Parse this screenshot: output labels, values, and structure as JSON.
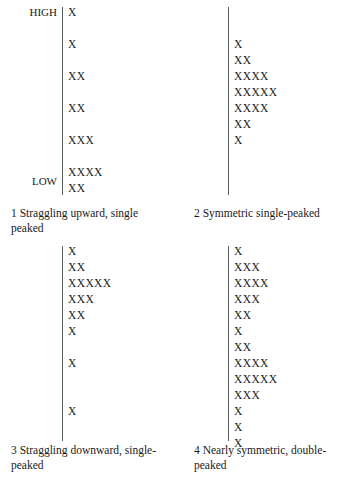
{
  "figure": {
    "axis_labels": {
      "high": "HIGH",
      "low": "LOW"
    },
    "accent_color": "#555f66",
    "text_color": "#1a1a1a",
    "mark": "X"
  },
  "panels": [
    {
      "id": "panel-1",
      "number": "1",
      "caption": "1  Straggling upward, single peaked",
      "shape_name": "Straggling upward, single peaked",
      "has_axis_labels": true,
      "counts": [
        1,
        0,
        1,
        0,
        2,
        0,
        2,
        0,
        3,
        0,
        4,
        2
      ],
      "rows": [
        "X",
        "",
        "X",
        "",
        "XX",
        "",
        "XX",
        "",
        "XXX",
        "",
        "XXXX",
        "XX"
      ]
    },
    {
      "id": "panel-2",
      "number": "2",
      "caption": "2  Symmetric single-peaked",
      "shape_name": "Symmetric single-peaked",
      "has_axis_labels": false,
      "counts": [
        0,
        0,
        1,
        2,
        4,
        5,
        4,
        2,
        1
      ],
      "rows": [
        "",
        "",
        "X",
        "XX",
        "XXXX",
        "XXXXX",
        "XXXX",
        "XX",
        "X"
      ]
    },
    {
      "id": "panel-3",
      "number": "3",
      "caption": "3  Straggling downward, single-peaked",
      "shape_name": "Straggling downward, single-peaked",
      "has_axis_labels": false,
      "counts": [
        1,
        2,
        5,
        3,
        2,
        1,
        0,
        1,
        0,
        0,
        1
      ],
      "rows": [
        "X",
        "XX",
        "XXXXX",
        "XXX",
        "XX",
        "X",
        "",
        "X",
        "",
        "",
        "X"
      ]
    },
    {
      "id": "panel-4",
      "number": "4",
      "caption": "4  Nearly symmetric, double-peaked",
      "shape_name": "Nearly symmetric, double-peaked",
      "has_axis_labels": false,
      "counts": [
        1,
        3,
        4,
        3,
        2,
        1,
        2,
        4,
        5,
        3,
        1,
        1,
        1
      ],
      "rows": [
        "X",
        "XXX",
        "XXXX",
        "XXX",
        "XX",
        "X",
        "XX",
        "XXXX",
        "XXXXX",
        "XXX",
        "X",
        "X",
        "X"
      ]
    }
  ],
  "chart_data": {
    "type": "bar",
    "title": "",
    "xlabel": "",
    "ylabel": "",
    "orientation": "horizontal-dotplot",
    "note": "Four schematic tally/dot-plot distributions drawn with X marks; vertical axis runs HIGH at top to LOW at bottom; each row's X count is the frequency at that level.",
    "axis_ticks": [
      "HIGH",
      "LOW"
    ],
    "grid": false,
    "legend": "none",
    "series": [
      {
        "name": "1  Straggling upward, single peaked",
        "values": [
          1,
          0,
          1,
          0,
          2,
          0,
          2,
          0,
          3,
          0,
          4,
          2
        ]
      },
      {
        "name": "2  Symmetric single-peaked",
        "values": [
          0,
          0,
          1,
          2,
          4,
          5,
          4,
          2,
          1
        ]
      },
      {
        "name": "3  Straggling downward, single-peaked",
        "values": [
          1,
          2,
          5,
          3,
          2,
          1,
          0,
          1,
          0,
          0,
          1
        ]
      },
      {
        "name": "4  Nearly symmetric, double-peaked",
        "values": [
          1,
          3,
          4,
          3,
          2,
          1,
          2,
          4,
          5,
          3,
          1,
          1,
          1
        ]
      }
    ]
  }
}
